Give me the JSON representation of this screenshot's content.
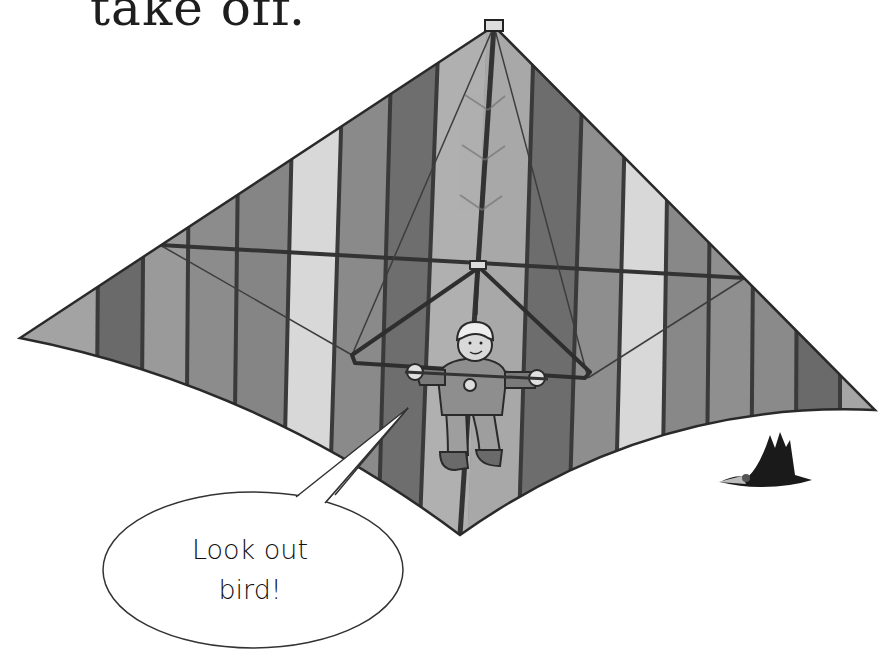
{
  "caption": {
    "text": "take off."
  },
  "speech_bubble": {
    "line1": "Look out",
    "line2": "bird!"
  },
  "illustration": {
    "subject": "hang-glider pilot under striped triangular wing",
    "elements": [
      "hang-glider-wing",
      "control-bar",
      "pilot",
      "bird",
      "speech-bubble"
    ]
  },
  "colors": {
    "background": "#ffffff",
    "stripe_dark": "#6a6a6a",
    "stripe_mid": "#8c8c8c",
    "stripe_light": "#a3a3a3",
    "stripe_pale": "#d6d6d6",
    "seam": "#3a3a3a",
    "outline": "#2a2a2a"
  }
}
